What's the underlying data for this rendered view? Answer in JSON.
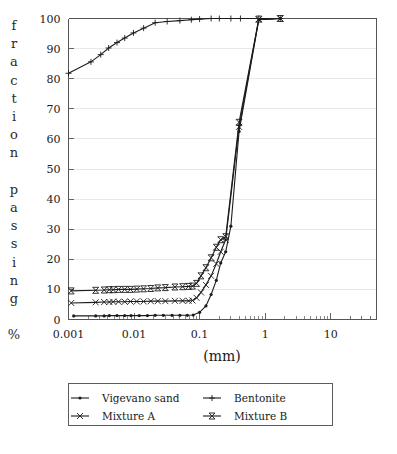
{
  "chart_data": {
    "type": "line",
    "title": "",
    "xlabel": "(mm)",
    "ylabel": "fraction passing %",
    "xscale": "log",
    "xlim": [
      0.001,
      50
    ],
    "ylim": [
      0,
      100
    ],
    "grid": true,
    "legend_position": "below-center",
    "x_tick_labels": [
      "0.001",
      "0.01",
      "0.1",
      "1",
      "10"
    ],
    "x_tick_values": [
      0.001,
      0.01,
      0.1,
      1,
      10
    ],
    "y_tick_labels": [
      "0",
      "10",
      "20",
      "30",
      "40",
      "50",
      "60",
      "70",
      "80",
      "90",
      "100"
    ],
    "y_tick_values": [
      0,
      10,
      20,
      30,
      40,
      50,
      60,
      70,
      80,
      90,
      100
    ],
    "series": [
      {
        "name": "Vigevano sand",
        "marker": "dot",
        "x": [
          0.0012,
          0.0026,
          0.0035,
          0.0042,
          0.0055,
          0.0072,
          0.009,
          0.012,
          0.016,
          0.021,
          0.028,
          0.038,
          0.05,
          0.065,
          0.08,
          0.1,
          0.125,
          0.15,
          0.18,
          0.21,
          0.25,
          0.3,
          0.4,
          0.8,
          1.7
        ],
        "y": [
          1.2,
          1.2,
          1.2,
          1.3,
          1.3,
          1.3,
          1.3,
          1.3,
          1.3,
          1.4,
          1.4,
          1.4,
          1.4,
          1.4,
          1.5,
          2.4,
          4.5,
          8.3,
          13.0,
          18.8,
          22.5,
          31.0,
          62.5,
          99.6,
          100.0
        ]
      },
      {
        "name": "Bentonite",
        "marker": "plus",
        "x": [
          0.001,
          0.0022,
          0.0031,
          0.0041,
          0.0055,
          0.0072,
          0.0098,
          0.014,
          0.021,
          0.032,
          0.05,
          0.075,
          0.1,
          0.15,
          0.2,
          0.3,
          0.42,
          0.8,
          1.7
        ],
        "y": [
          81.8,
          85.6,
          88.0,
          90.2,
          92.0,
          93.5,
          95.2,
          96.8,
          98.6,
          99.0,
          99.3,
          99.6,
          99.8,
          100.0,
          100.0,
          100.0,
          100.0,
          100.0,
          100.0
        ]
      },
      {
        "name": "Mixture A",
        "marker": "x",
        "x": [
          0.0011,
          0.0026,
          0.0035,
          0.0042,
          0.0048,
          0.0058,
          0.0072,
          0.0088,
          0.011,
          0.014,
          0.018,
          0.023,
          0.03,
          0.042,
          0.055,
          0.068,
          0.078,
          0.09,
          0.105,
          0.125,
          0.15,
          0.18,
          0.21,
          0.25,
          0.4,
          0.8,
          1.7
        ],
        "y": [
          5.5,
          5.7,
          5.8,
          5.8,
          5.9,
          5.9,
          5.9,
          6.0,
          6.0,
          6.0,
          6.1,
          6.1,
          6.1,
          6.2,
          6.2,
          6.2,
          6.3,
          7.2,
          9.0,
          11.5,
          14.5,
          18.5,
          22.5,
          26.5,
          64.0,
          99.7,
          100.0
        ]
      },
      {
        "name": "Mixture B",
        "marker": "bowtie",
        "x": [
          0.0011,
          0.0026,
          0.0035,
          0.0042,
          0.0048,
          0.0058,
          0.0072,
          0.0088,
          0.011,
          0.014,
          0.018,
          0.023,
          0.03,
          0.042,
          0.055,
          0.068,
          0.078,
          0.09,
          0.105,
          0.125,
          0.15,
          0.18,
          0.21,
          0.25,
          0.4,
          0.8,
          1.7
        ],
        "y": [
          9.5,
          9.7,
          9.8,
          9.9,
          9.9,
          10.0,
          10.0,
          10.0,
          10.1,
          10.2,
          10.3,
          10.5,
          10.6,
          10.8,
          10.9,
          11.0,
          11.1,
          12.0,
          14.5,
          17.2,
          20.5,
          24.0,
          26.5,
          27.5,
          65.5,
          99.8,
          100.0
        ]
      }
    ]
  },
  "legend": {
    "entries": [
      {
        "label": "Vigevano sand",
        "marker": "dot"
      },
      {
        "label": "Bentonite",
        "marker": "plus"
      },
      {
        "label": "Mixture A",
        "marker": "x"
      },
      {
        "label": "Mixture B",
        "marker": "bowtie"
      }
    ]
  },
  "colors": {
    "line": "#1c1c1c",
    "axis": "#555555",
    "grid": "#dedede",
    "text": "#1a1a1a",
    "background": "#ffffff"
  }
}
